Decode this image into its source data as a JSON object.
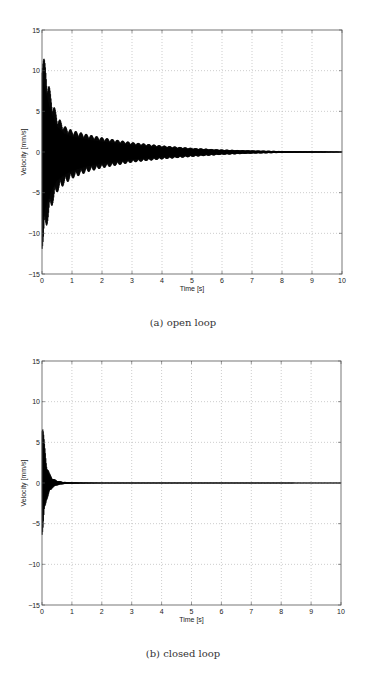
{
  "chart_data": [
    {
      "type": "line",
      "title": "",
      "subfigure_caption": "(a) open loop",
      "xlabel": "Time [s]",
      "ylabel": "Velocity [mm/s]",
      "xlim": [
        0,
        10
      ],
      "ylim": [
        -15,
        15
      ],
      "xticks": [
        0,
        1,
        2,
        3,
        4,
        5,
        6,
        7,
        8,
        9,
        10
      ],
      "yticks": [
        -15,
        -10,
        -5,
        0,
        5,
        10,
        15
      ],
      "grid": true,
      "series": [
        {
          "name": "velocity (oscillation envelope)",
          "envelope_time": [
            0,
            0.05,
            0.1,
            0.2,
            0.3,
            0.5,
            0.75,
            1,
            1.5,
            2,
            3,
            4,
            5,
            6,
            7,
            8,
            9,
            10
          ],
          "envelope_upper": [
            13,
            12,
            11,
            9,
            7,
            4.5,
            3.2,
            2.7,
            2.2,
            1.8,
            1.2,
            0.8,
            0.5,
            0.3,
            0.2,
            0.12,
            0.08,
            0.05
          ],
          "envelope_lower": [
            -12,
            -11.5,
            -10,
            -8.5,
            -7,
            -5,
            -4,
            -3.3,
            -2.5,
            -2,
            -1.3,
            -0.9,
            -0.6,
            -0.35,
            -0.2,
            -0.12,
            -0.08,
            -0.05
          ]
        }
      ]
    },
    {
      "type": "line",
      "title": "",
      "subfigure_caption": "(b) closed loop",
      "xlabel": "Time [s]",
      "ylabel": "Velocity [mm/s]",
      "xlim": [
        0,
        10
      ],
      "ylim": [
        -15,
        15
      ],
      "xticks": [
        0,
        1,
        2,
        3,
        4,
        5,
        6,
        7,
        8,
        9,
        10
      ],
      "yticks": [
        -15,
        -10,
        -5,
        0,
        5,
        10,
        15
      ],
      "grid": true,
      "series": [
        {
          "name": "velocity (oscillation envelope)",
          "envelope_time": [
            0,
            0.03,
            0.08,
            0.15,
            0.25,
            0.35,
            0.5,
            0.7,
            1,
            1.5,
            2,
            10
          ],
          "envelope_upper": [
            8.5,
            7.5,
            5,
            2.5,
            1.2,
            0.6,
            0.3,
            0.15,
            0.08,
            0.05,
            0.03,
            0.02
          ],
          "envelope_lower": [
            -6.5,
            -6,
            -4,
            -2.2,
            -1.2,
            -0.6,
            -0.3,
            -0.15,
            -0.08,
            -0.05,
            -0.03,
            -0.02
          ]
        }
      ]
    }
  ],
  "figures": {
    "a": {
      "caption": "(a) open loop",
      "xlabel": "Time [s]",
      "ylabel": "Velocity [mm/s]"
    },
    "b": {
      "caption": "(b) closed loop",
      "xlabel": "Time [s]",
      "ylabel": "Velocity [mm/s]"
    }
  }
}
